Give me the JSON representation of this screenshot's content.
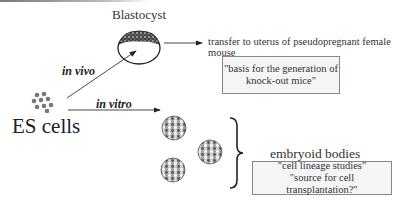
{
  "diagram": {
    "blastocyst_label": "Blastocyst",
    "es_cells_label": "ES cells",
    "in_vivo_label": "in vivo",
    "in_vitro_label": "in vitro",
    "transfer_text": "transfer to uterus of pseudopregnant female mouse",
    "knockout_box": {
      "line1": "\"basis for the generation of",
      "line2": "knock-out mice\""
    },
    "embryoid_label": "embryoid bodies",
    "embryoid_box": {
      "line1": "\"cell lineage studies\"",
      "line2": "\"source for cell transplantation?\""
    },
    "colors": {
      "line": "#333333",
      "box_fill": "#f5f5f5",
      "box_border": "#888888",
      "cell_dot": "#777777"
    }
  }
}
